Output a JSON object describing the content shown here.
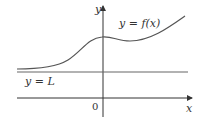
{
  "diagram": {
    "type": "function-graph",
    "labels": {
      "y_axis": "y",
      "x_axis": "x",
      "origin": "0",
      "curve": "y = f(x)",
      "asymptote": "y = L"
    },
    "colors": {
      "axes": "#333333",
      "curve": "#555555",
      "asymptote": "#666666"
    }
  }
}
